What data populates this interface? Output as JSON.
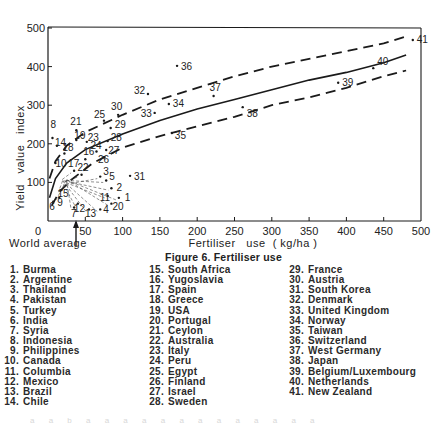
{
  "figure": {
    "caption": "Figure 6. Fertiliser use",
    "world_average_label": "World average",
    "footer_faint": "a a b a a a a a a a a a a a a a"
  },
  "chart_data": {
    "type": "scatter",
    "title": "Figure 6. Fertiliser use",
    "xlabel": "Fertiliser   use  ( kg/ha )",
    "ylabel": "Yield   value   index",
    "xlim": [
      0,
      500
    ],
    "ylim": [
      0,
      500
    ],
    "x_ticks": [
      0,
      50,
      100,
      150,
      200,
      250,
      300,
      350,
      400,
      450,
      500
    ],
    "y_ticks": [
      0,
      100,
      200,
      300,
      400,
      500
    ],
    "grid": false,
    "legend_position": "below",
    "annotations": [
      {
        "text": "World average",
        "x": 37,
        "type": "arrow-up-to-axis"
      }
    ],
    "curves": [
      {
        "name": "fitted trend",
        "style": "solid",
        "points": [
          [
            2,
            60
          ],
          [
            10,
            110
          ],
          [
            25,
            150
          ],
          [
            50,
            185
          ],
          [
            100,
            225
          ],
          [
            150,
            260
          ],
          [
            200,
            290
          ],
          [
            250,
            315
          ],
          [
            300,
            340
          ],
          [
            350,
            365
          ],
          [
            400,
            385
          ],
          [
            450,
            410
          ],
          [
            480,
            430
          ]
        ]
      },
      {
        "name": "upper bound",
        "style": "dashed",
        "points": [
          [
            2,
            110
          ],
          [
            10,
            155
          ],
          [
            25,
            195
          ],
          [
            50,
            230
          ],
          [
            100,
            275
          ],
          [
            150,
            315
          ],
          [
            200,
            345
          ],
          [
            250,
            375
          ],
          [
            300,
            400
          ],
          [
            350,
            420
          ],
          [
            400,
            440
          ],
          [
            450,
            460
          ],
          [
            480,
            478
          ]
        ]
      },
      {
        "name": "lower bound",
        "style": "dashed",
        "points": [
          [
            5,
            40
          ],
          [
            15,
            75
          ],
          [
            30,
            105
          ],
          [
            60,
            150
          ],
          [
            100,
            190
          ],
          [
            150,
            220
          ],
          [
            200,
            245
          ],
          [
            250,
            270
          ],
          [
            300,
            300
          ],
          [
            350,
            320
          ],
          [
            400,
            345
          ],
          [
            450,
            375
          ],
          [
            480,
            390
          ]
        ]
      }
    ],
    "series": [
      {
        "name": "Countries",
        "points": [
          {
            "id": 1,
            "country": "Burma",
            "x": 95,
            "y": 60
          },
          {
            "id": 2,
            "country": "Argentine",
            "x": 85,
            "y": 85
          },
          {
            "id": 3,
            "country": "Thailand",
            "x": 70,
            "y": 115
          },
          {
            "id": 4,
            "country": "Pakistan",
            "x": 70,
            "y": 30
          },
          {
            "id": 5,
            "country": "Turkey",
            "x": 78,
            "y": 105
          },
          {
            "id": 6,
            "country": "India",
            "x": 7,
            "y": 50
          },
          {
            "id": 7,
            "country": "Syria",
            "x": 35,
            "y": 35
          },
          {
            "id": 8,
            "country": "Indonesia",
            "x": 6,
            "y": 215
          },
          {
            "id": 9,
            "country": "Philippines",
            "x": 15,
            "y": 60
          },
          {
            "id": 10,
            "country": "Canada",
            "x": 10,
            "y": 150
          },
          {
            "id": 11,
            "country": "Columbia",
            "x": 80,
            "y": 65
          },
          {
            "id": 12,
            "country": "Mexico",
            "x": 40,
            "y": 45
          },
          {
            "id": 13,
            "country": "Brazil",
            "x": 55,
            "y": 30
          },
          {
            "id": 14,
            "country": "Chile",
            "x": 12,
            "y": 195
          },
          {
            "id": 15,
            "country": "South Africa",
            "x": 18,
            "y": 80
          },
          {
            "id": 16,
            "country": "Yugoslavia",
            "x": 50,
            "y": 160
          },
          {
            "id": 17,
            "country": "Spain",
            "x": 35,
            "y": 130
          },
          {
            "id": 18,
            "country": "Greece",
            "x": 22,
            "y": 175
          },
          {
            "id": 19,
            "country": "USA",
            "x": 38,
            "y": 210
          },
          {
            "id": 20,
            "country": "Portugal",
            "x": 85,
            "y": 45
          },
          {
            "id": 21,
            "country": "Ceylon",
            "x": 38,
            "y": 235
          },
          {
            "id": 22,
            "country": "Australia",
            "x": 45,
            "y": 120
          },
          {
            "id": 23,
            "country": "Italy",
            "x": 52,
            "y": 205
          },
          {
            "id": 24,
            "country": "Peru",
            "x": 65,
            "y": 180
          },
          {
            "id": 25,
            "country": "Egypt",
            "x": 75,
            "y": 260
          },
          {
            "id": 26,
            "country": "Finland",
            "x": 75,
            "y": 165
          },
          {
            "id": 27,
            "country": "Israel",
            "x": 78,
            "y": 184
          },
          {
            "id": 28,
            "country": "Sweden",
            "x": 80,
            "y": 207
          },
          {
            "id": 29,
            "country": "France",
            "x": 84,
            "y": 241
          },
          {
            "id": 30,
            "country": "Austria",
            "x": 94,
            "y": 275
          },
          {
            "id": 31,
            "country": "South Korea",
            "x": 110,
            "y": 117
          },
          {
            "id": 32,
            "country": "Denmark",
            "x": 134,
            "y": 329
          },
          {
            "id": 33,
            "country": "United Kingdom",
            "x": 143,
            "y": 280
          },
          {
            "id": 34,
            "country": "Norway",
            "x": 162,
            "y": 303
          },
          {
            "id": 35,
            "country": "Taiwan",
            "x": 166,
            "y": 228
          },
          {
            "id": 36,
            "country": "Switzerland",
            "x": 173,
            "y": 402
          },
          {
            "id": 37,
            "country": "West Germany",
            "x": 222,
            "y": 324
          },
          {
            "id": 38,
            "country": "Japan",
            "x": 261,
            "y": 295
          },
          {
            "id": 39,
            "country": "Belgium/Luxembourg",
            "x": 389,
            "y": 358
          },
          {
            "id": 40,
            "country": "Netherlands",
            "x": 436,
            "y": 396
          },
          {
            "id": 41,
            "country": "New Zealand",
            "x": 489,
            "y": 469
          }
        ]
      }
    ]
  },
  "axes": {
    "y_title": "Yield   value   index",
    "x_title": "Fertiliser   use  ( kg/ha )",
    "x_ticks": [
      "0",
      "50",
      "100",
      "150",
      "200",
      "250",
      "300",
      "350",
      "400",
      "450",
      "500"
    ],
    "y_ticks": [
      "100",
      "200",
      "300",
      "400",
      "500"
    ]
  },
  "legend": {
    "columns": [
      [
        {
          "num": "1.",
          "name": "Burma"
        },
        {
          "num": "2.",
          "name": "Argentine"
        },
        {
          "num": "3.",
          "name": "Thailand"
        },
        {
          "num": "4.",
          "name": "Pakistan"
        },
        {
          "num": "5.",
          "name": "Turkey"
        },
        {
          "num": "6.",
          "name": "India"
        },
        {
          "num": "7.",
          "name": "Syria"
        },
        {
          "num": "8.",
          "name": "Indonesia"
        },
        {
          "num": "9.",
          "name": "Philippines"
        },
        {
          "num": "10.",
          "name": "Canada"
        },
        {
          "num": "11.",
          "name": "Columbia"
        },
        {
          "num": "12.",
          "name": "Mexico"
        },
        {
          "num": "13.",
          "name": "Brazil"
        },
        {
          "num": "14.",
          "name": "Chile"
        }
      ],
      [
        {
          "num": "15.",
          "name": "South Africa"
        },
        {
          "num": "16.",
          "name": "Yugoslavia"
        },
        {
          "num": "17.",
          "name": "Spain"
        },
        {
          "num": "18.",
          "name": "Greece"
        },
        {
          "num": "19.",
          "name": "USA"
        },
        {
          "num": "20.",
          "name": "Portugal"
        },
        {
          "num": "21.",
          "name": "Ceylon"
        },
        {
          "num": "22.",
          "name": "Australia"
        },
        {
          "num": "23.",
          "name": "Italy"
        },
        {
          "num": "24.",
          "name": "Peru"
        },
        {
          "num": "25.",
          "name": "Egypt"
        },
        {
          "num": "26.",
          "name": "Finland"
        },
        {
          "num": "27.",
          "name": "Israel"
        },
        {
          "num": "28.",
          "name": "Sweden"
        }
      ],
      [
        {
          "num": "29.",
          "name": "France"
        },
        {
          "num": "30.",
          "name": "Austria"
        },
        {
          "num": "31.",
          "name": "South Korea"
        },
        {
          "num": "32.",
          "name": "Denmark"
        },
        {
          "num": "33.",
          "name": "United Kingdom"
        },
        {
          "num": "34.",
          "name": "Norway"
        },
        {
          "num": "35.",
          "name": "Taiwan"
        },
        {
          "num": "36.",
          "name": "Switzerland"
        },
        {
          "num": "37.",
          "name": "West Germany"
        },
        {
          "num": "38.",
          "name": "Japan"
        },
        {
          "num": "39.",
          "name": "Belgium/Luxembourg"
        },
        {
          "num": "40.",
          "name": "Netherlands"
        },
        {
          "num": "41.",
          "name": "New Zealand"
        }
      ]
    ]
  },
  "colors": {
    "ink": "#1a1a1a",
    "paper": "#ffffff"
  }
}
